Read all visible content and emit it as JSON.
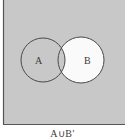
{
  "diagram": {
    "type": "venn",
    "universe": {
      "fill": "#c8c8c8",
      "border_color": "#555555"
    },
    "sets": [
      {
        "label": "A",
        "cx": 43,
        "cy": 60,
        "r": 22,
        "fill": "#c8c8c8"
      },
      {
        "label": "B",
        "cx": 81,
        "cy": 60,
        "r": 23,
        "fill": "#fafafa"
      }
    ],
    "intersection_fill": "#c8c8c8",
    "stroke": "#4a4a4a",
    "shaded_region": "A ∪ B'",
    "caption": "A∪B'"
  }
}
